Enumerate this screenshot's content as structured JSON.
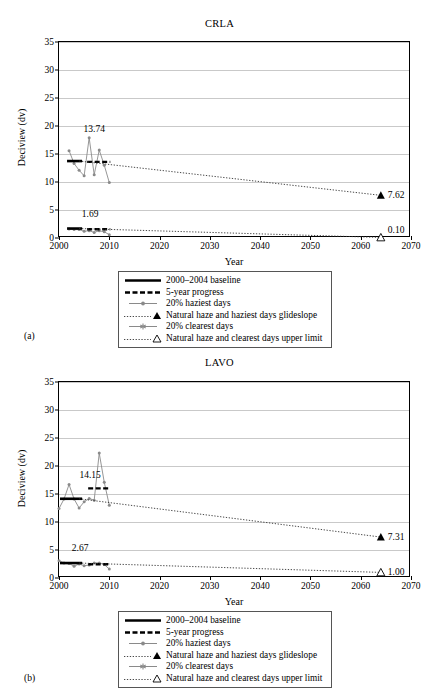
{
  "figure": {
    "panels": [
      {
        "tag": "(a)",
        "chart_data": {
          "type": "line",
          "title": "CRLA",
          "xlabel": "Year",
          "ylabel": "Deciview (dv)",
          "xlim": [
            2000,
            2070
          ],
          "ylim": [
            0,
            35
          ],
          "xticks": [
            2000,
            2010,
            2020,
            2030,
            2040,
            2050,
            2060,
            2070
          ],
          "yticks": [
            0,
            5,
            10,
            15,
            20,
            25,
            30,
            35
          ],
          "grid": "horizontal",
          "legend_position": "below-plot",
          "annotations": [
            {
              "text": "13.74",
              "x": 2007,
              "y": 18.6
            },
            {
              "text": "1.69",
              "x": 2006.2,
              "y": 3.4
            },
            {
              "text": "7.62",
              "x": 2065,
              "y": 7.62
            },
            {
              "text": "0.10",
              "x": 2065,
              "y": 1.5
            }
          ],
          "series": [
            {
              "name": "20% haziest days",
              "type": "line-marker",
              "color": "#8a8a8a",
              "x": [
                2002,
                2003,
                2004,
                2005,
                2006,
                2007,
                2008,
                2009,
                2010
              ],
              "values": [
                15.6,
                13.3,
                12.1,
                11.1,
                17.9,
                11.3,
                15.7,
                13.0,
                9.9
              ]
            },
            {
              "name": "20% clearest days",
              "type": "line-marker",
              "color": "#8a8a8a",
              "x": [
                2002,
                2003,
                2004,
                2005,
                2006,
                2007,
                2008,
                2009,
                2010
              ],
              "values": [
                1.6,
                1.5,
                1.5,
                1.2,
                1.3,
                1.0,
                1.3,
                1.1,
                0.6
              ]
            },
            {
              "name": "2000–2004 baseline",
              "type": "solid-segment",
              "color": "#000000",
              "segments": [
                {
                  "x0": 2001.6,
                  "x1": 2004.6,
                  "y": 13.74
                },
                {
                  "x0": 2001.6,
                  "x1": 2004.6,
                  "y": 1.69
                }
              ]
            },
            {
              "name": "5-year progress",
              "type": "dashed-segment",
              "color": "#000000",
              "segments": [
                {
                  "x0": 2005.6,
                  "x1": 2010.2,
                  "y": 13.6
                },
                {
                  "x0": 2005.6,
                  "x1": 2010.2,
                  "y": 1.55
                }
              ]
            },
            {
              "name": "Natural haze and haziest days glideslope",
              "type": "dotted-line",
              "color": "#333333",
              "x": [
                2004,
                2064
              ],
              "values": [
                13.74,
                7.62
              ],
              "endpoint_marker": "filled-triangle",
              "endpoint_value": 7.62
            },
            {
              "name": "Natural haze and clearest days upper limit",
              "type": "dotted-line",
              "color": "#333333",
              "x": [
                2004,
                2064
              ],
              "values": [
                1.69,
                0.1
              ],
              "endpoint_marker": "open-triangle",
              "endpoint_value": 0.1
            }
          ]
        },
        "legend": [
          {
            "key": "solid",
            "label": "2000–2004 baseline"
          },
          {
            "key": "dashed",
            "label": "5-year progress"
          },
          {
            "key": "line-dot",
            "label": "20% haziest days"
          },
          {
            "key": "dotted-filled-triangle",
            "label": "Natural haze and haziest days glideslope"
          },
          {
            "key": "line-star",
            "label": "20% clearest days"
          },
          {
            "key": "dotted-open-triangle",
            "label": "Natural haze and clearest days upper limit"
          }
        ]
      },
      {
        "tag": "(b)",
        "chart_data": {
          "type": "line",
          "title": "LAVO",
          "xlabel": "Year",
          "ylabel": "Deciview (dv)",
          "xlim": [
            2000,
            2070
          ],
          "ylim": [
            0,
            35
          ],
          "xticks": [
            2000,
            2010,
            2020,
            2030,
            2040,
            2050,
            2060,
            2070
          ],
          "yticks": [
            0,
            5,
            10,
            15,
            20,
            25,
            30,
            35
          ],
          "grid": "horizontal",
          "legend_position": "below-plot",
          "annotations": [
            {
              "text": "14.15",
              "x": 2006.2,
              "y": 17.5
            },
            {
              "text": "2.67",
              "x": 2004.2,
              "y": 4.4
            },
            {
              "text": "7.31",
              "x": 2065,
              "y": 7.31
            },
            {
              "text": "1.00",
              "x": 2065,
              "y": 1.0
            }
          ],
          "series": [
            {
              "name": "20% haziest days",
              "type": "line-marker",
              "color": "#8a8a8a",
              "x": [
                2000,
                2001,
                2002,
                2003,
                2004,
                2005,
                2006,
                2007,
                2008,
                2009,
                2010
              ],
              "values": [
                12.4,
                14.1,
                16.7,
                14.1,
                12.5,
                13.6,
                14.2,
                13.9,
                22.3,
                17.1,
                13.0
              ]
            },
            {
              "name": "20% clearest days",
              "type": "line-marker",
              "color": "#8a8a8a",
              "x": [
                2000,
                2001,
                2002,
                2003,
                2004,
                2005,
                2006,
                2007,
                2008,
                2009,
                2010
              ],
              "values": [
                3.1,
                2.7,
                2.6,
                2.1,
                2.5,
                2.2,
                2.3,
                2.7,
                2.7,
                2.4,
                1.6
              ]
            },
            {
              "name": "2000–2004 baseline",
              "type": "solid-segment",
              "color": "#000000",
              "segments": [
                {
                  "x0": 2000.2,
                  "x1": 2004.6,
                  "y": 14.15
                },
                {
                  "x0": 2000.2,
                  "x1": 2004.6,
                  "y": 2.67
                }
              ]
            },
            {
              "name": "5-year progress",
              "type": "dashed-segment",
              "color": "#000000",
              "segments": [
                {
                  "x0": 2005.8,
                  "x1": 2010.2,
                  "y": 16.0
                },
                {
                  "x0": 2005.8,
                  "x1": 2010.2,
                  "y": 2.45
                }
              ]
            },
            {
              "name": "Natural haze and haziest days glideslope",
              "type": "dotted-line",
              "color": "#333333",
              "x": [
                2004,
                2064
              ],
              "values": [
                14.15,
                7.31
              ],
              "endpoint_marker": "filled-triangle",
              "endpoint_value": 7.31
            },
            {
              "name": "Natural haze and clearest days upper limit",
              "type": "dotted-line",
              "color": "#333333",
              "x": [
                2004,
                2064
              ],
              "values": [
                2.67,
                1.0
              ],
              "endpoint_marker": "open-triangle",
              "endpoint_value": 1.0
            }
          ]
        },
        "legend": [
          {
            "key": "solid",
            "label": "2000–2004 baseline"
          },
          {
            "key": "dashed",
            "label": "5-year progress"
          },
          {
            "key": "line-dot",
            "label": "20% haziest days"
          },
          {
            "key": "dotted-filled-triangle",
            "label": "Natural haze and haziest days glideslope"
          },
          {
            "key": "line-star",
            "label": "20% clearest days"
          },
          {
            "key": "dotted-open-triangle",
            "label": "Natural haze and clearest days upper limit"
          }
        ]
      }
    ]
  }
}
